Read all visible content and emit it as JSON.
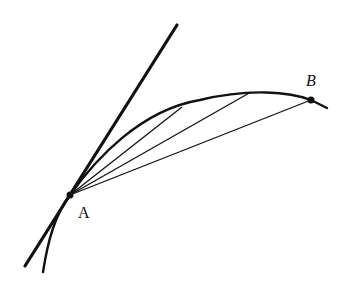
{
  "diagram": {
    "colors": {
      "stroke": "#111111",
      "background": "#ffffff"
    },
    "points": [
      {
        "id": "A",
        "label": "A",
        "x": 70,
        "y": 195
      },
      {
        "id": "B",
        "label": "B",
        "x": 311,
        "y": 100
      }
    ],
    "labels": {
      "A": "A",
      "B": "B"
    },
    "tangent_line": {
      "x1": 25,
      "y1": 266,
      "x2": 177,
      "y2": 25
    },
    "curve": "M 43 272 C 48 240, 55 215, 70 195 C 95 160, 140 110, 200 100 C 250 88, 290 92, 311 100 L 327 108",
    "chords": [
      {
        "to": "P1",
        "x2": 182,
        "y2": 107
      },
      {
        "to": "P2",
        "x2": 251,
        "y2": 92
      },
      {
        "to": "B",
        "x2": 311,
        "y2": 100
      }
    ]
  }
}
